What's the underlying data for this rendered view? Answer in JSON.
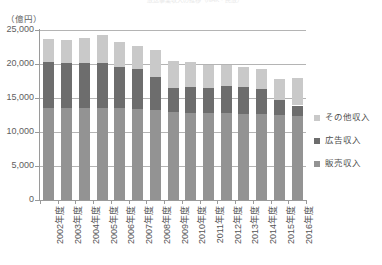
{
  "chart": {
    "title": "放送事業収入の推移（NHK・民放）",
    "y_unit": "（億円）",
    "y_ticks": [
      "25,000",
      "20,000",
      "15,000",
      "10,000",
      "5,000",
      "0"
    ]
  },
  "legend": {
    "items": [
      {
        "label": "その他収入",
        "color": "#c9c9c9",
        "key": "other"
      },
      {
        "label": "広告収入",
        "color": "#6d6d6d",
        "key": "ads"
      },
      {
        "label": "販売収入",
        "color": "#939393",
        "key": "sales"
      }
    ]
  },
  "chart_data": {
    "type": "bar",
    "stacked": true,
    "title": "放送事業収入の推移（NHK・民放）",
    "xlabel": "",
    "ylabel": "（億円）",
    "ylim": [
      0,
      25000
    ],
    "ytick_values": [
      0,
      5000,
      10000,
      15000,
      20000,
      25000
    ],
    "grid": true,
    "legend_position": "right",
    "categories": [
      "2002年度",
      "2003年度",
      "2004年度",
      "2005年度",
      "2006年度",
      "2007年度",
      "2008年度",
      "2009年度",
      "2010年度",
      "2011年度",
      "2012年度",
      "2013年度",
      "2014年度",
      "2015年度",
      "2016年度"
    ],
    "series": [
      {
        "name": "販売収入",
        "color": "#939393",
        "values": [
          13500,
          13500,
          13500,
          13500,
          13500,
          13400,
          13300,
          12900,
          12800,
          12800,
          12800,
          12700,
          12600,
          12500,
          12400
        ]
      },
      {
        "name": "広告収入",
        "color": "#6d6d6d",
        "values": [
          6800,
          6700,
          6700,
          6600,
          6100,
          5900,
          4800,
          3600,
          3800,
          3700,
          3900,
          3900,
          3700,
          2200,
          1500
        ]
      },
      {
        "name": "その他収入",
        "color": "#c9c9c9",
        "values": [
          3400,
          3400,
          3600,
          4100,
          3700,
          3400,
          3900,
          3900,
          3700,
          3400,
          3100,
          3000,
          2900,
          3100,
          4000
        ]
      }
    ],
    "totals": [
      23700,
      23600,
      23800,
      24200,
      23300,
      22700,
      22000,
      20400,
      20300,
      19900,
      19800,
      19600,
      19200,
      17800,
      17900
    ]
  }
}
